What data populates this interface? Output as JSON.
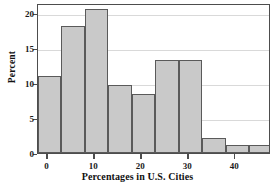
{
  "chart_data": {
    "type": "bar",
    "title": "",
    "xlabel": "Percentages in U.S. Cities",
    "ylabel": "Percent",
    "bin_width": 5,
    "bin_starts": [
      -2,
      3,
      8,
      13,
      18,
      23,
      28,
      33,
      38,
      43
    ],
    "categories": [
      "-2 to 3",
      "3 to 8",
      "8 to 13",
      "13 to 18",
      "18 to 23",
      "23 to 28",
      "28 to 33",
      "33 to 38",
      "38 to 43",
      "43 to 48"
    ],
    "values": [
      11.0,
      18.1,
      20.6,
      9.7,
      8.4,
      13.3,
      13.3,
      2.2,
      1.1,
      1.1
    ],
    "xlim": [
      -2,
      47.6
    ],
    "ylim": [
      0,
      21.4
    ],
    "x_ticks": [
      0,
      10,
      20,
      30,
      40
    ],
    "x_tick_labels": [
      "0",
      "10",
      "20",
      "30",
      "40"
    ],
    "y_ticks": [
      0,
      5,
      10,
      15,
      20
    ],
    "y_tick_labels": [
      "0",
      "5",
      "10",
      "15",
      "20"
    ],
    "grid": "horizontal",
    "legend": "none",
    "bar_fill_color": "#c9c9c9",
    "bar_edge_color": "#5a5a5a",
    "grid_color": "#d9d9d9",
    "axis_color": "#4d4d4d"
  }
}
